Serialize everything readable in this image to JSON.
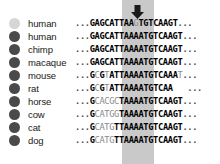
{
  "figure": {
    "type": "multiple-sequence-alignment",
    "width": 220,
    "height": 164,
    "background": "#ffffff"
  },
  "marker": {
    "arrow_name": "down-arrow-marker",
    "arrow_glyph": "⬇",
    "arrow_color": "#1a1a1a",
    "highlight_color": "#c9c9c9",
    "highlight_left": 122,
    "highlight_width": 32
  },
  "colors": {
    "dot_highlight": "#d6d6d6",
    "dot_default": "#4a4a4a",
    "text_bold": "#000000",
    "text_dim": "#8a8a8a"
  },
  "rows": [
    {
      "label": "human",
      "dot_color": "#d6d6d6",
      "sequence": "...GAGCATTAAGTGTCAAGT...",
      "parts": [
        {
          "text": "...",
          "style": "ell"
        },
        {
          "text": "GAGCATTAA",
          "style": "bold"
        },
        {
          "text": "G",
          "style": "dim"
        },
        {
          "text": "TGTCAAGT",
          "style": "bold"
        },
        {
          "text": "...",
          "style": "ell"
        }
      ]
    },
    {
      "label": "human",
      "dot_color": "#4a4a4a",
      "sequence": "...GAGCATTAAAATGTCAAGT...",
      "parts": [
        {
          "text": "...",
          "style": "ell"
        },
        {
          "text": "GAGCATTAAAATGTCAAGT",
          "style": "bold"
        },
        {
          "text": "...",
          "style": "ell"
        }
      ]
    },
    {
      "label": "chimp",
      "dot_color": "#4a4a4a",
      "sequence": "...GAGCATTAAAATGTCAAGT...",
      "parts": [
        {
          "text": "...",
          "style": "ell"
        },
        {
          "text": "GAGCATTAAAATGTCAAGT",
          "style": "bold"
        },
        {
          "text": "...",
          "style": "ell"
        }
      ]
    },
    {
      "label": "macaque",
      "dot_color": "#4a4a4a",
      "sequence": "...GAGCATTAAAATGTCAAGT...",
      "parts": [
        {
          "text": "...",
          "style": "ell"
        },
        {
          "text": "GAGCATTAAAATGTCAAGT",
          "style": "bold"
        },
        {
          "text": "...",
          "style": "ell"
        }
      ]
    },
    {
      "label": "mouse",
      "dot_color": "#4a4a4a",
      "sequence": "...GCGTATTAAAATGTCAAAT...",
      "parts": [
        {
          "text": "...",
          "style": "ell"
        },
        {
          "text": "G",
          "style": "bold"
        },
        {
          "text": "C",
          "style": "dim"
        },
        {
          "text": "G",
          "style": "bold"
        },
        {
          "text": "T",
          "style": "dim"
        },
        {
          "text": "ATTAAAATGTCAAA",
          "style": "bold"
        },
        {
          "text": "T",
          "style": "dim"
        },
        {
          "text": "...",
          "style": "ell"
        }
      ]
    },
    {
      "label": "rat",
      "dot_color": "#4a4a4a",
      "sequence": "...GCGTATTAAAATGTCAA   ...",
      "parts": [
        {
          "text": "...",
          "style": "ell"
        },
        {
          "text": "G",
          "style": "bold"
        },
        {
          "text": "C",
          "style": "dim"
        },
        {
          "text": "G",
          "style": "bold"
        },
        {
          "text": "T",
          "style": "dim"
        },
        {
          "text": "ATTAAAATGTCAA",
          "style": "bold"
        },
        {
          "text": "   ",
          "style": "bold"
        },
        {
          "text": "...",
          "style": "ell"
        }
      ]
    },
    {
      "label": "horse",
      "dot_color": "#4a4a4a",
      "sequence": "...GCACGCTAAAATGTCAAGT...",
      "parts": [
        {
          "text": "...",
          "style": "ell"
        },
        {
          "text": "G",
          "style": "bold"
        },
        {
          "text": "CACGC",
          "style": "dim"
        },
        {
          "text": "TAAAATGTCAAGT",
          "style": "bold"
        },
        {
          "text": "...",
          "style": "ell"
        }
      ]
    },
    {
      "label": "cow",
      "dot_color": "#4a4a4a",
      "sequence": "...GCATGGTAAAATGTCAAGT...",
      "parts": [
        {
          "text": "...",
          "style": "ell"
        },
        {
          "text": "G",
          "style": "bold"
        },
        {
          "text": "CATGG",
          "style": "dim"
        },
        {
          "text": "TAAAATGTCAAGT",
          "style": "bold"
        },
        {
          "text": "...",
          "style": "ell"
        }
      ]
    },
    {
      "label": "cat",
      "dot_color": "#4a4a4a",
      "sequence": "...GCATGTTAAAATGTCAAGT...",
      "parts": [
        {
          "text": "...",
          "style": "ell"
        },
        {
          "text": "G",
          "style": "bold"
        },
        {
          "text": "CATG",
          "style": "dim"
        },
        {
          "text": "TTAAAATGTCAAGT",
          "style": "bold"
        },
        {
          "text": "...",
          "style": "ell"
        }
      ]
    },
    {
      "label": "dog",
      "dot_color": "#4a4a4a",
      "sequence": "...GCATGTTAAAATGTCAAGT...",
      "parts": [
        {
          "text": "...",
          "style": "ell"
        },
        {
          "text": "G",
          "style": "bold"
        },
        {
          "text": "CATG",
          "style": "dim"
        },
        {
          "text": "TTAAAATGTCAAGT",
          "style": "bold"
        },
        {
          "text": "...",
          "style": "ell"
        }
      ]
    }
  ]
}
